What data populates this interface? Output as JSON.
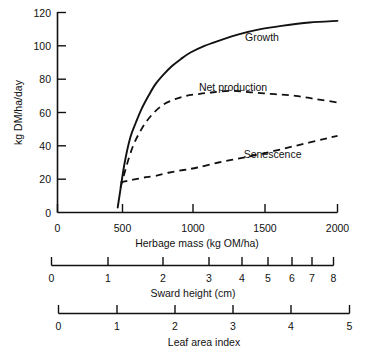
{
  "figure": {
    "background_color": "#ffffff",
    "ink_color": "#111111"
  },
  "chart_data": {
    "type": "line",
    "title": "",
    "subtitle": "",
    "xlabel": "Herbage mass (kg OM/ha)",
    "ylabel": "kg DM/ha/day",
    "xlim": [
      0,
      2000
    ],
    "ylim": [
      0,
      120
    ],
    "grid": false,
    "legend": "inline-annotations",
    "x_ticks": [
      0,
      500,
      1000,
      1500,
      2000
    ],
    "x_tick_labels": [
      "0",
      "500",
      "1000",
      "1500",
      "2000"
    ],
    "y_ticks": [
      0,
      20,
      40,
      60,
      80,
      100,
      120
    ],
    "y_tick_labels": [
      "0",
      "20",
      "40",
      "60",
      "80",
      "100",
      "120"
    ],
    "series": [
      {
        "name": "Growth",
        "style": "solid",
        "label_position": {
          "x": 1340,
          "y": 103
        },
        "x": [
          430,
          450,
          480,
          520,
          560,
          600,
          650,
          700,
          760,
          820,
          880,
          950,
          1050,
          1150,
          1300,
          1450,
          1600,
          1800,
          2000
        ],
        "values": [
          3,
          14,
          30,
          45,
          54,
          62,
          70,
          77,
          83,
          88,
          92,
          96,
          100,
          103,
          107,
          110,
          112,
          114,
          115
        ]
      },
      {
        "name": "Net production",
        "style": "dashed",
        "label_position": {
          "x": 1010,
          "y": 73
        },
        "x": [
          450,
          470,
          500,
          540,
          580,
          630,
          690,
          760,
          840,
          920,
          1000,
          1100,
          1250,
          1400,
          1550,
          1700,
          1850,
          2000
        ],
        "values": [
          15,
          21,
          30,
          40,
          47,
          54,
          60,
          65,
          68,
          70,
          71,
          72,
          73,
          72,
          71,
          70,
          68,
          66
        ]
      },
      {
        "name": "Senescence",
        "style": "dashed",
        "label_position": {
          "x": 1330,
          "y": 33
        },
        "x": [
          450,
          500,
          560,
          620,
          700,
          800,
          900,
          1000,
          1150,
          1300,
          1450,
          1600,
          1750,
          1900,
          2000
        ],
        "values": [
          18,
          19,
          20,
          21,
          22,
          24,
          25.5,
          27,
          30,
          32.5,
          35,
          38,
          41,
          44,
          46
        ]
      }
    ],
    "secondary_axes": [
      {
        "name": "sward-height",
        "title": "Sward height (cm)",
        "tick_labels": [
          "0",
          "1",
          "2",
          "3",
          "4",
          "5",
          "6",
          "7",
          "8"
        ],
        "tick_positions_px": [
          51,
          108,
          163,
          209,
          242,
          268,
          292,
          312,
          333
        ],
        "spacing": "non-linear"
      },
      {
        "name": "leaf-area-index",
        "title": "Leaf area index",
        "tick_labels": [
          "0",
          "1",
          "2",
          "3",
          "4",
          "5"
        ],
        "tick_positions_px": [
          58,
          117,
          175,
          233,
          291,
          349
        ],
        "spacing": "linear"
      }
    ]
  }
}
